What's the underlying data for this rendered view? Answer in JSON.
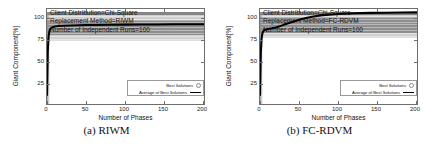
{
  "figure": {
    "panels": [
      {
        "id": "riwm",
        "caption": "(a) RIWM",
        "annotation": [
          "Client Distribution=Chi-Square",
          "Replacement Method=RIWM",
          "Number of Independent Runs=100"
        ],
        "legend": {
          "best_solutions": "Best Solutions",
          "average_of_best_solutions": "Average of Best Solutions"
        }
      },
      {
        "id": "fcrdvm",
        "caption": "(b) FC-RDVM",
        "annotation": [
          "Client Distribution=Chi-Square",
          "Replacement Method=FC-RDVM",
          "Number of Independent Runs=100"
        ],
        "legend": {
          "best_solutions": "Best Solutions",
          "average_of_best_solutions": "Average of Best Solutions"
        }
      }
    ]
  },
  "chart_data": [
    {
      "type": "line",
      "id": "riwm",
      "title": "(a) RIWM",
      "xlabel": "Number of Phases",
      "ylabel": "Giant Component[%]",
      "xlim": [
        0,
        200
      ],
      "ylim": [
        10,
        103
      ],
      "xticks": [
        0,
        50,
        100,
        150,
        200
      ],
      "yticks": [
        25,
        50,
        75,
        100
      ],
      "grid": false,
      "legend_position": "lower-right",
      "annotations": [
        "Client Distribution=Chi-Square",
        "Replacement Method=RIWM",
        "Number of Independent Runs=100"
      ],
      "series": [
        {
          "name": "Average of Best Solutions",
          "style": "thick-black-line",
          "x": [
            0,
            1,
            2,
            3,
            4,
            5,
            6,
            8,
            10,
            15,
            20,
            30,
            40,
            50,
            60,
            80,
            100,
            120,
            140,
            160,
            180,
            200
          ],
          "values": [
            18,
            62,
            76,
            81,
            83,
            84,
            84.8,
            85.4,
            85.8,
            86.3,
            86.6,
            86.9,
            87.1,
            87.3,
            87.4,
            87.6,
            87.7,
            87.8,
            87.9,
            88.0,
            88.0,
            88.1
          ]
        },
        {
          "name": "Best Solutions",
          "style": "grey-circle-scatter-cloud",
          "spread_note": "dense horizontal band of individual run results",
          "band_low": 73,
          "band_high": 100,
          "band_dense_low": 78,
          "band_dense_high": 92
        }
      ]
    },
    {
      "type": "line",
      "id": "fcrdvm",
      "title": "(b) FC-RDVM",
      "xlabel": "Number of Phases",
      "ylabel": "Giant Component[%]",
      "xlim": [
        0,
        200
      ],
      "ylim": [
        10,
        103
      ],
      "xticks": [
        0,
        50,
        100,
        150,
        200
      ],
      "yticks": [
        25,
        50,
        75,
        100
      ],
      "grid": false,
      "legend_position": "lower-right",
      "annotations": [
        "Client Distribution=Chi-Square",
        "Replacement Method=FC-RDVM",
        "Number of Independent Runs=100"
      ],
      "series": [
        {
          "name": "Average of Best Solutions",
          "style": "thick-black-line",
          "x": [
            0,
            1,
            2,
            3,
            4,
            5,
            8,
            10,
            15,
            20,
            25,
            30,
            40,
            50,
            60,
            70,
            80,
            100,
            120,
            140,
            160,
            180,
            200
          ],
          "values": [
            18,
            60,
            74,
            79,
            81,
            82,
            83,
            83.5,
            84.2,
            85,
            86,
            87.5,
            90,
            92.5,
            94.5,
            96,
            97,
            98.2,
            98.8,
            99.2,
            99.4,
            99.6,
            99.7
          ]
        },
        {
          "name": "Best Solutions",
          "style": "grey-circle-scatter-cloud",
          "spread_note": "dense horizontal band of individual run results",
          "band_low": 76,
          "band_high": 100,
          "band_dense_low": 80,
          "band_dense_high": 95
        }
      ]
    }
  ]
}
